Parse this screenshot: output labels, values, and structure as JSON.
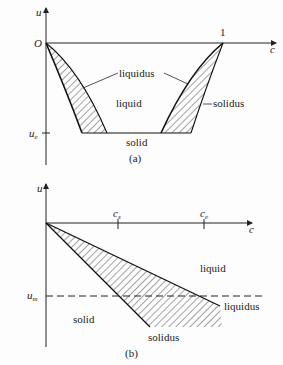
{
  "figure": {
    "panel_a": {
      "caption": "(a)",
      "axis_y_label": "u",
      "axis_x_label": "c",
      "origin_label": "O",
      "tick_x_label": "1",
      "tick_y_label_base": "u",
      "tick_y_label_sub": "e",
      "region_labels": {
        "liquidus": "liquidus",
        "liquid": "liquid",
        "solidus": "solidus",
        "solid": "solid"
      }
    },
    "panel_b": {
      "caption": "(b)",
      "axis_y_label": "u",
      "axis_x_label": "c",
      "tick_x1_base": "c",
      "tick_x1_sub": "s",
      "tick_x2_base": "c",
      "tick_x2_sub": "e",
      "tick_y_label_base": "u",
      "tick_y_label_sub": "m",
      "region_labels": {
        "liquid": "liquid",
        "liquidus": "liquidus",
        "solid": "solid",
        "solidus": "solidus"
      }
    }
  }
}
